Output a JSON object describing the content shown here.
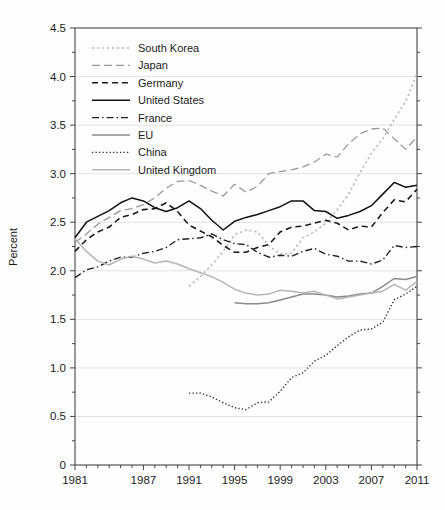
{
  "chart_data": {
    "type": "line",
    "title": "",
    "xlabel": "",
    "ylabel": "Percent",
    "xlim": [
      1981,
      2011
    ],
    "ylim": [
      0,
      4.5
    ],
    "grid": "horizontal light-gray lines every 0.5, frame box around plot, legend top-left inside plot",
    "legend_position": "top-left",
    "axis_color": "#444444",
    "grid_color": "#e2e2e2",
    "ytick_step_major": 0.5,
    "ytick_step_minor": 0.25,
    "ytick_labels": [
      "0",
      "0.5",
      "1.0",
      "1.5",
      "2.0",
      "2.5",
      "3.0",
      "3.5",
      "4.0",
      "4.5"
    ],
    "xtick_labeled_years": [
      1981,
      1987,
      1991,
      1995,
      1999,
      2003,
      2007,
      2011
    ],
    "xtick_minor_step_years": 1,
    "series": [
      {
        "name": "South Korea",
        "color": "#b9b9b9",
        "style": "dotted",
        "start_year": 1991,
        "values": [
          1.84,
          1.94,
          2.06,
          2.2,
          2.37,
          2.42,
          2.4,
          2.26,
          2.17,
          2.18,
          2.34,
          2.4,
          2.49,
          2.63,
          2.79,
          3.01,
          3.21,
          3.36,
          3.56,
          3.74,
          4.03
        ]
      },
      {
        "name": "Japan",
        "color": "#999999",
        "style": "dashed-long",
        "start_year": 1981,
        "values": [
          2.29,
          2.38,
          2.48,
          2.55,
          2.62,
          2.64,
          2.68,
          2.75,
          2.85,
          2.92,
          2.93,
          2.88,
          2.82,
          2.77,
          2.89,
          2.81,
          2.87,
          3.0,
          3.02,
          3.04,
          3.07,
          3.12,
          3.2,
          3.17,
          3.31,
          3.41,
          3.46,
          3.47,
          3.36,
          3.25,
          3.38
        ]
      },
      {
        "name": "Germany",
        "color": "#1a1a1a",
        "style": "dashed",
        "start_year": 1981,
        "values": [
          2.2,
          2.32,
          2.4,
          2.45,
          2.55,
          2.58,
          2.63,
          2.64,
          2.7,
          2.61,
          2.47,
          2.41,
          2.35,
          2.26,
          2.19,
          2.19,
          2.24,
          2.27,
          2.4,
          2.45,
          2.46,
          2.49,
          2.52,
          2.49,
          2.42,
          2.46,
          2.45,
          2.6,
          2.73,
          2.71,
          2.84
        ]
      },
      {
        "name": "United States",
        "color": "#111111",
        "style": "solid",
        "start_year": 1981,
        "values": [
          2.34,
          2.5,
          2.56,
          2.62,
          2.7,
          2.75,
          2.72,
          2.65,
          2.61,
          2.65,
          2.72,
          2.64,
          2.52,
          2.42,
          2.51,
          2.55,
          2.58,
          2.62,
          2.66,
          2.72,
          2.72,
          2.62,
          2.61,
          2.54,
          2.57,
          2.61,
          2.67,
          2.79,
          2.91,
          2.86,
          2.88
        ]
      },
      {
        "name": "France",
        "color": "#222222",
        "style": "dashdot",
        "start_year": 1981,
        "values": [
          1.93,
          2.01,
          2.04,
          2.1,
          2.14,
          2.14,
          2.18,
          2.2,
          2.24,
          2.32,
          2.33,
          2.34,
          2.38,
          2.32,
          2.28,
          2.27,
          2.19,
          2.14,
          2.16,
          2.15,
          2.2,
          2.23,
          2.17,
          2.15,
          2.1,
          2.1,
          2.07,
          2.11,
          2.26,
          2.24,
          2.25
        ]
      },
      {
        "name": "EU",
        "color": "#8a8a8a",
        "style": "solid",
        "start_year": 1995,
        "values": [
          1.67,
          1.66,
          1.66,
          1.67,
          1.7,
          1.73,
          1.76,
          1.76,
          1.75,
          1.73,
          1.74,
          1.76,
          1.77,
          1.84,
          1.92,
          1.91,
          1.94
        ]
      },
      {
        "name": "China",
        "color": "#2b2b2b",
        "style": "fine-dotted",
        "start_year": 1991,
        "values": [
          0.74,
          0.74,
          0.7,
          0.64,
          0.59,
          0.57,
          0.64,
          0.65,
          0.76,
          0.9,
          0.95,
          1.07,
          1.13,
          1.23,
          1.32,
          1.39,
          1.4,
          1.47,
          1.7,
          1.76,
          1.84
        ]
      },
      {
        "name": "United Kingdom",
        "color": "#b5b5b5",
        "style": "solid",
        "start_year": 1981,
        "values": [
          2.33,
          2.2,
          2.1,
          2.06,
          2.12,
          2.15,
          2.12,
          2.08,
          2.1,
          2.07,
          2.02,
          1.98,
          1.94,
          1.88,
          1.81,
          1.77,
          1.75,
          1.76,
          1.8,
          1.79,
          1.77,
          1.79,
          1.75,
          1.71,
          1.73,
          1.75,
          1.77,
          1.79,
          1.86,
          1.8,
          1.89
        ]
      }
    ]
  }
}
